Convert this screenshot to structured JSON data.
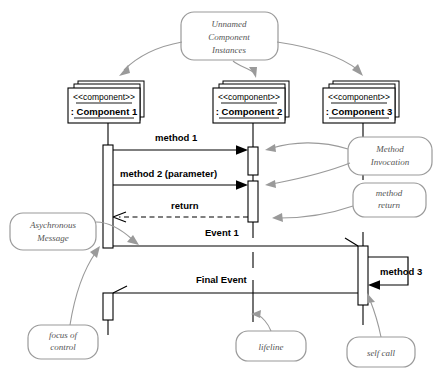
{
  "diagram": {
    "type": "uml-sequence-diagram"
  },
  "components": [
    {
      "stereotype": "<<component>>",
      "name": ": Component 1",
      "lifeline_x": 108
    },
    {
      "stereotype": "<<component>>",
      "name": ": Component 2",
      "lifeline_x": 253
    },
    {
      "stereotype": "<<component>>",
      "name": ": Component 3",
      "lifeline_x": 363
    }
  ],
  "messages": [
    {
      "label": "method 1",
      "kind": "synchronous-call",
      "from": "Component 1",
      "to": "Component 2"
    },
    {
      "label": "method 2 (parameter)",
      "kind": "synchronous-call",
      "from": "Component 1",
      "to": "Component 2"
    },
    {
      "label": "return",
      "kind": "return",
      "from": "Component 2",
      "to": "Component 1"
    },
    {
      "label": "Event 1",
      "kind": "asynchronous",
      "from": "Component 1",
      "to": "Component 3"
    },
    {
      "label": "Final Event",
      "kind": "asynchronous",
      "from": "Component 3",
      "to": "Component 1"
    },
    {
      "label": "method 3",
      "kind": "self-call",
      "from": "Component 3",
      "to": "Component 3"
    }
  ],
  "annotations": [
    {
      "id": "unnamed-instances",
      "lines": [
        "Unnamed",
        "Component",
        "Instances"
      ]
    },
    {
      "id": "method-invocation",
      "lines": [
        "Method",
        "Invocation"
      ]
    },
    {
      "id": "method-return",
      "lines": [
        "method",
        "return"
      ]
    },
    {
      "id": "asychronous-message",
      "lines": [
        "Asychronous",
        "Message"
      ]
    },
    {
      "id": "focus-of-control",
      "lines": [
        "focus of",
        "control"
      ]
    },
    {
      "id": "lifeline",
      "lines": [
        "lifeline"
      ]
    },
    {
      "id": "self-call",
      "lines": [
        "self call"
      ]
    }
  ],
  "colors": {
    "line": "#000000",
    "annotation": "#9a9a9a",
    "annotation_text": "#555555",
    "background": "#ffffff"
  }
}
